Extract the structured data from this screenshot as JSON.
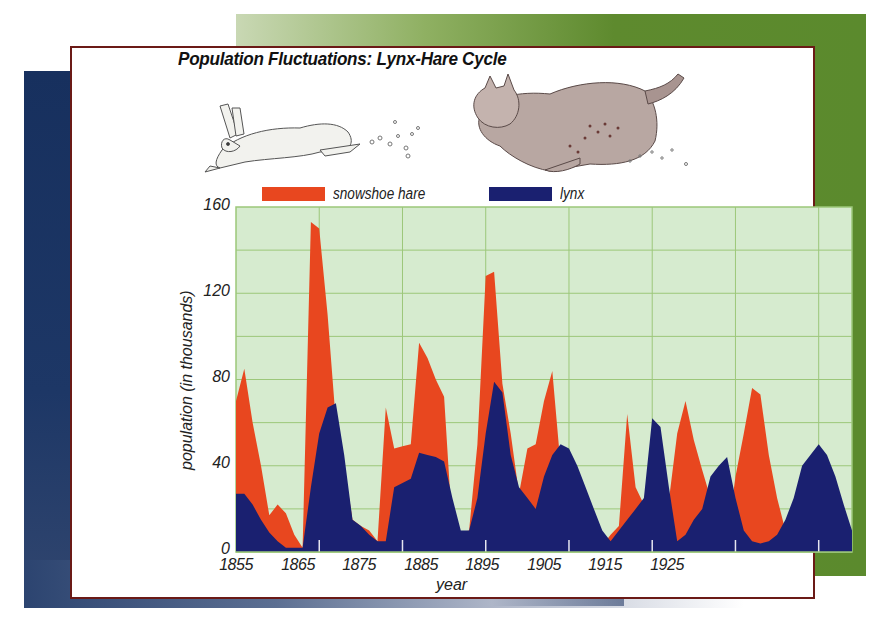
{
  "title": "Population Fluctuations: Lynx-Hare Cycle",
  "legend": [
    {
      "label": "snowshoe hare",
      "color": "#e8471f"
    },
    {
      "label": "lynx",
      "color": "#1a2070"
    }
  ],
  "illustrations": {
    "hare": "running-snowshoe-hare",
    "lynx": "running-lynx"
  },
  "colors": {
    "plot_bg": "#d6ebcf",
    "grid": "#9cc77a",
    "frame": "#6b1a16",
    "bg_green": "#5b8a2d",
    "bg_blue": "#1d3766"
  },
  "chart_data": {
    "type": "area",
    "title": "Population Fluctuations: Lynx-Hare Cycle",
    "xlabel": "year",
    "ylabel": "population (in thousands)",
    "xlim": [
      1855,
      1929
    ],
    "ylim": [
      0,
      160
    ],
    "x_ticks": [
      "1855",
      "1865",
      "1875",
      "1885",
      "1895",
      "1905",
      "1915",
      "1925"
    ],
    "y_ticks": [
      "0",
      "40",
      "80",
      "120",
      "160"
    ],
    "grid": true,
    "legend_position": "top",
    "x": [
      1855,
      1856,
      1857,
      1858,
      1859,
      1860,
      1861,
      1862,
      1863,
      1864,
      1865,
      1866,
      1867,
      1868,
      1869,
      1870,
      1871,
      1872,
      1873,
      1874,
      1875,
      1876,
      1877,
      1878,
      1879,
      1880,
      1881,
      1882,
      1883,
      1884,
      1885,
      1886,
      1887,
      1888,
      1889,
      1890,
      1891,
      1892,
      1893,
      1894,
      1895,
      1896,
      1897,
      1898,
      1899,
      1900,
      1901,
      1902,
      1903,
      1904,
      1905,
      1906,
      1907,
      1908,
      1909,
      1910,
      1911,
      1912,
      1913,
      1914,
      1915,
      1916,
      1917,
      1918,
      1919,
      1920,
      1921,
      1922,
      1923,
      1924,
      1925,
      1926,
      1927,
      1928,
      1929
    ],
    "series": [
      {
        "name": "snowshoe hare",
        "color": "#e8471f",
        "values": [
          70,
          85,
          60,
          40,
          17,
          22,
          18,
          8,
          2,
          153,
          150,
          110,
          60,
          40,
          15,
          12,
          10,
          5,
          67,
          48,
          49,
          50,
          97,
          90,
          80,
          72,
          10,
          9,
          10,
          50,
          128,
          130,
          78,
          55,
          27,
          48,
          50,
          70,
          84,
          40,
          30,
          20,
          10,
          5,
          3,
          8,
          12,
          64,
          30,
          22,
          20,
          22,
          24,
          55,
          70,
          52,
          38,
          25,
          5,
          6,
          35,
          55,
          76,
          73,
          45,
          25,
          10,
          8,
          6,
          5,
          4,
          6,
          8,
          10,
          8
        ]
      },
      {
        "name": "lynx",
        "color": "#1a2070",
        "values": [
          27,
          27,
          22,
          15,
          9,
          5,
          2,
          2,
          2,
          30,
          55,
          67,
          69,
          45,
          15,
          12,
          8,
          5,
          5,
          30,
          32,
          34,
          46,
          45,
          44,
          42,
          25,
          10,
          10,
          25,
          55,
          79,
          74,
          45,
          30,
          25,
          20,
          35,
          45,
          50,
          48,
          40,
          30,
          20,
          10,
          5,
          10,
          15,
          20,
          25,
          62,
          58,
          30,
          5,
          8,
          15,
          20,
          35,
          40,
          44,
          25,
          10,
          5,
          4,
          5,
          8,
          15,
          25,
          40,
          45,
          50,
          45,
          35,
          22,
          10
        ]
      }
    ]
  }
}
